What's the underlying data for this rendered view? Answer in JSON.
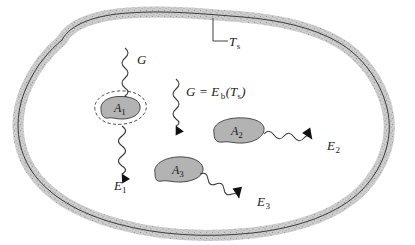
{
  "figure": {
    "name": "radiation-enclosure-diagram",
    "colors": {
      "outline": "#2b2b2b",
      "wall_band": "#d9d9d9",
      "wall_speckle": "#9a9a9a",
      "blob_fill": "#b3b3b3",
      "blob_stroke": "#3a3a3a",
      "arrow": "#111111",
      "text": "#1a1a1a",
      "background": "#ffffff"
    }
  },
  "enclosure": {
    "label": "T",
    "label_sub": "s",
    "label_full": "Ts",
    "leader_note": "leader line from Ts label up to enclosure wall"
  },
  "irradiation_left": {
    "label": "G",
    "arrow_direction": "down"
  },
  "irradiation_center": {
    "lhs": "G",
    "equals": "=",
    "rhs_main": "E",
    "rhs_sub": "b",
    "paren_open": "(",
    "rhs_arg": "T",
    "rhs_arg_sub": "s",
    "paren_close": ")",
    "label_full": "G = Eb(Ts)",
    "arrow_direction": "down"
  },
  "surfaces": [
    {
      "id": "A1",
      "label": "A",
      "label_sub": "1",
      "has_control_surface": true,
      "control_surface_style": "dashed"
    },
    {
      "id": "A2",
      "label": "A",
      "label_sub": "2",
      "has_control_surface": false,
      "control_surface_style": "none"
    },
    {
      "id": "A3",
      "label": "A",
      "label_sub": "3",
      "has_control_surface": false,
      "control_surface_style": "none"
    }
  ],
  "emissions": [
    {
      "id": "E1",
      "label": "E",
      "label_sub": "1",
      "from": "A1",
      "arrow_direction": "down"
    },
    {
      "id": "E2",
      "label": "E",
      "label_sub": "2",
      "from": "A2",
      "arrow_direction": "right-down"
    },
    {
      "id": "E3",
      "label": "E",
      "label_sub": "3",
      "from": "A3",
      "arrow_direction": "right-down"
    }
  ]
}
